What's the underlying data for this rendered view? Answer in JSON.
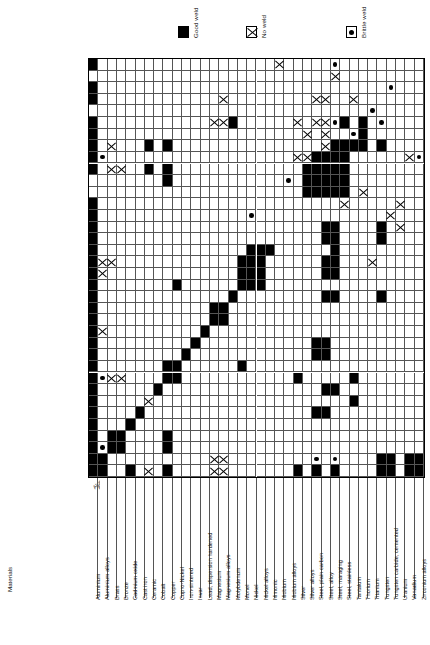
{
  "axis_caption": "Materials",
  "legend": {
    "items": [
      {
        "symbol": "good",
        "label": "Good weld"
      },
      {
        "symbol": "no",
        "label": "No weld"
      },
      {
        "symbol": "brittle",
        "label": "Brittle weld"
      }
    ]
  },
  "colors": {
    "good": "#000000",
    "no": "#000000",
    "brittle": "#000000",
    "grid": "#555555",
    "border": "#000000",
    "background": "#ffffff"
  },
  "chart_data": {
    "type": "heatmap",
    "xlabel": "Materials",
    "ylabel": "Materials",
    "legend_position": "top",
    "grid": true,
    "symbols": {
      "good": "Good weld",
      "no": "No weld",
      "brittle": "Brittle weld",
      "blank": "Not rated"
    },
    "categories": [
      "Aluminium",
      "Aluminium alloys",
      "Brass",
      "Bronze",
      "Cadmium oxide",
      "Cast iron",
      "Ceramic",
      "Cobalt",
      "Copper",
      "Cupro-Nickel",
      "Iron-sintered",
      "Invar",
      "Lead, dispersion hardened",
      "Magnesium",
      "Magnesium alloys",
      "Molybdenum",
      "Monel",
      "Nickel",
      "Nickel alloys",
      "Nimonic",
      "Niobium",
      "Niobium alloys",
      "Silver",
      "Silver alloys",
      "Steel, plain carbon",
      "Steel, alloy",
      "Steel, maraging",
      "Steel, stainless",
      "Tantalum",
      "Thorium",
      "Titanium",
      "Tungsten",
      "Tungsten carbide, cemented",
      "Uranium",
      "Vanadium",
      "Zirconium alloys"
    ],
    "rows": [
      {
        "name": "Zirconium alloys",
        "cells": {
          "0": "good",
          "20": "no",
          "26": "brittle"
        }
      },
      {
        "name": "Vanadium",
        "cells": {
          "26": "no"
        }
      },
      {
        "name": "Uranium",
        "cells": {
          "0": "good",
          "32": "brittle"
        }
      },
      {
        "name": "Tungsten carbide, cemented",
        "cells": {
          "0": "good",
          "14": "no",
          "24": "no",
          "25": "no",
          "28": "no"
        }
      },
      {
        "name": "Tungsten",
        "cells": {
          "30": "brittle"
        }
      },
      {
        "name": "Titanium",
        "cells": {
          "0": "good",
          "13": "no",
          "14": "no",
          "15": "good",
          "22": "no",
          "24": "no",
          "25": "no",
          "26": "brittle",
          "27": "good",
          "29": "good",
          "31": "brittle"
        }
      },
      {
        "name": "Thorium",
        "cells": {
          "0": "good",
          "23": "no",
          "25": "no",
          "28": "brittle",
          "29": "good"
        }
      },
      {
        "name": "Tantalum",
        "cells": {
          "0": "good",
          "2": "no",
          "6": "good",
          "8": "good",
          "25": "no",
          "26": "good",
          "27": "good",
          "28": "good",
          "29": "good",
          "31": "good"
        }
      },
      {
        "name": "Steel, stainless",
        "cells": {
          "0": "good",
          "1": "brittle",
          "22": "no",
          "23": "no",
          "24": "good",
          "25": "good",
          "26": "good",
          "27": "good",
          "34": "no",
          "35": "brittle"
        }
      },
      {
        "name": "Steel, maraging",
        "cells": {
          "0": "good",
          "2": "no",
          "3": "no",
          "6": "good",
          "8": "good",
          "23": "good",
          "24": "good",
          "25": "good",
          "26": "good",
          "27": "good"
        }
      },
      {
        "name": "Steel, alloy",
        "cells": {
          "8": "good",
          "21": "brittle",
          "23": "good",
          "24": "good",
          "25": "good",
          "26": "good",
          "27": "good"
        }
      },
      {
        "name": "Steel, plain carbon",
        "cells": {
          "23": "good",
          "24": "good",
          "25": "good",
          "26": "good",
          "27": "good",
          "29": "no"
        }
      },
      {
        "name": "Silver alloys",
        "cells": {
          "0": "good",
          "27": "no",
          "33": "no"
        }
      },
      {
        "name": "Silver",
        "cells": {
          "0": "good",
          "17": "brittle",
          "32": "no"
        }
      },
      {
        "name": "Niobium alloys",
        "cells": {
          "0": "good",
          "25": "good",
          "26": "good",
          "31": "good",
          "33": "no"
        }
      },
      {
        "name": "Niobium",
        "cells": {
          "0": "good",
          "25": "good",
          "26": "good",
          "31": "good"
        }
      },
      {
        "name": "Nimonic",
        "cells": {
          "0": "good",
          "17": "good",
          "18": "good",
          "19": "good",
          "26": "good"
        }
      },
      {
        "name": "Nickel alloys",
        "cells": {
          "0": "good",
          "1": "no",
          "2": "no",
          "16": "good",
          "17": "good",
          "18": "good",
          "25": "good",
          "26": "good",
          "30": "no"
        }
      },
      {
        "name": "Nickel",
        "cells": {
          "0": "good",
          "1": "no",
          "16": "good",
          "17": "good",
          "18": "good",
          "25": "good",
          "26": "good"
        }
      },
      {
        "name": "Monel",
        "cells": {
          "0": "good",
          "9": "good",
          "16": "good",
          "17": "good",
          "18": "good"
        }
      },
      {
        "name": "Molybdenum",
        "cells": {
          "0": "good",
          "15": "good",
          "25": "good",
          "26": "good",
          "31": "good"
        }
      },
      {
        "name": "Magnesium alloys",
        "cells": {
          "0": "good",
          "13": "good",
          "14": "good"
        }
      },
      {
        "name": "Magnesium",
        "cells": {
          "0": "good",
          "13": "good",
          "14": "good"
        }
      },
      {
        "name": "Lead, dispersion hardened",
        "cells": {
          "0": "good",
          "1": "no",
          "12": "good"
        }
      },
      {
        "name": "Invar",
        "cells": {
          "0": "good",
          "11": "good",
          "24": "good",
          "25": "good"
        }
      },
      {
        "name": "Iron-sintered",
        "cells": {
          "0": "good",
          "10": "good",
          "24": "good",
          "25": "good"
        }
      },
      {
        "name": "Cupro-Nickel",
        "cells": {
          "0": "good",
          "8": "good",
          "9": "good",
          "16": "good"
        }
      },
      {
        "name": "Copper",
        "cells": {
          "0": "good",
          "1": "brittle",
          "2": "no",
          "3": "no",
          "8": "good",
          "9": "good",
          "22": "good",
          "28": "good"
        }
      },
      {
        "name": "Cobalt",
        "cells": {
          "0": "good",
          "7": "good",
          "25": "good",
          "26": "good"
        }
      },
      {
        "name": "Ceramic",
        "cells": {
          "0": "good",
          "6": "no",
          "28": "good"
        }
      },
      {
        "name": "Cast iron",
        "cells": {
          "0": "good",
          "5": "good",
          "24": "good",
          "25": "good"
        }
      },
      {
        "name": "Cadmium oxide",
        "cells": {
          "0": "good",
          "4": "good"
        }
      },
      {
        "name": "Bronze",
        "cells": {
          "0": "good",
          "2": "good",
          "3": "good",
          "8": "good"
        }
      },
      {
        "name": "Brass",
        "cells": {
          "0": "good",
          "1": "brittle",
          "2": "good",
          "3": "good",
          "8": "good"
        }
      },
      {
        "name": "Aluminium alloys",
        "cells": {
          "0": "good",
          "1": "good",
          "13": "no",
          "14": "no",
          "24": "brittle",
          "26": "brittle",
          "31": "good",
          "32": "good",
          "34": "good",
          "35": "good"
        }
      },
      {
        "name": "Aluminium",
        "cells": {
          "0": "good",
          "1": "good",
          "4": "good",
          "6": "no",
          "8": "good",
          "13": "no",
          "14": "no",
          "22": "good",
          "24": "good",
          "26": "good",
          "31": "good",
          "32": "good",
          "34": "good",
          "35": "good"
        }
      }
    ]
  }
}
